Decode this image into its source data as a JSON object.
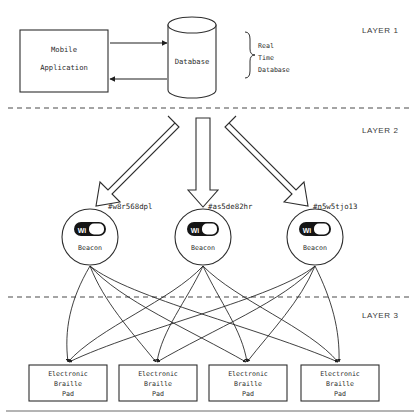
{
  "diagram": {
    "layers": [
      {
        "id": "layer1",
        "label": "LAYER 1"
      },
      {
        "id": "layer2",
        "label": "LAYER 2"
      },
      {
        "id": "layer3",
        "label": "LAYER 3"
      }
    ],
    "layer1": {
      "mobile_app": {
        "line1": "Mobile",
        "line2": "Application"
      },
      "database": {
        "label": "Database"
      },
      "annotation": {
        "line1": "Real",
        "line2": "Time",
        "line3": "Database"
      }
    },
    "layer2": {
      "beacons": [
        {
          "id": "beacon-1",
          "hash": "#w8r568dpl",
          "label": "Beacon",
          "badge": "Wi-Fi"
        },
        {
          "id": "beacon-2",
          "hash": "#as5de82hr",
          "label": "Beacon",
          "badge": "Wi-Fi"
        },
        {
          "id": "beacon-3",
          "hash": "#n5w5tjo13",
          "label": "Beacon",
          "badge": "Wi-Fi"
        }
      ],
      "wifi_badge": {
        "left": "Wi",
        "right": "Fi"
      }
    },
    "layer3": {
      "pads": [
        {
          "id": "pad-1",
          "line1": "Electronic",
          "line2": "Braille",
          "line3": "Pad"
        },
        {
          "id": "pad-2",
          "line1": "Electronic",
          "line2": "Braille",
          "line3": "Pad"
        },
        {
          "id": "pad-3",
          "line1": "Electronic",
          "line2": "Braille",
          "line3": "Pad"
        },
        {
          "id": "pad-4",
          "line1": "Electronic",
          "line2": "Braille",
          "line3": "Pad"
        }
      ]
    },
    "colors": {
      "stroke": "#2e2e2e",
      "text": "#2b2b2b",
      "divider": "#4a4a4a",
      "badge": "#151515",
      "background": "#ffffff"
    }
  }
}
